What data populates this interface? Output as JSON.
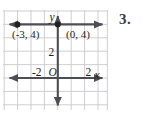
{
  "problem": {
    "number_label": "3."
  },
  "graph": {
    "axis_labels": {
      "x": "x",
      "y": "y",
      "origin": "O"
    },
    "tick_labels": {
      "x_negative_two": "-2",
      "x_positive_two": "2",
      "y_two": "2"
    },
    "point_labels": {
      "left_point": "(-3, 4)",
      "right_point": "(0, 4)"
    },
    "points": [
      {
        "label": "(-3, 4)",
        "x": -3,
        "y": 4
      },
      {
        "label": "(0, 4)",
        "x": 0,
        "y": 4
      }
    ],
    "line": {
      "equation": "y = 4",
      "through": [
        [
          -3,
          4
        ],
        [
          0,
          4
        ]
      ]
    },
    "grid": {
      "x_min": -4,
      "x_max": 3,
      "y_min": -2,
      "y_max": 5,
      "cell_size": 1,
      "visible": true
    },
    "colors": {
      "grid_line": "#c9c9cf",
      "axis": "#4d4d54",
      "plotted_line": "#4d4d54",
      "point_fill": "#231f20",
      "text": "#231f20",
      "background": "#ffffff"
    }
  }
}
